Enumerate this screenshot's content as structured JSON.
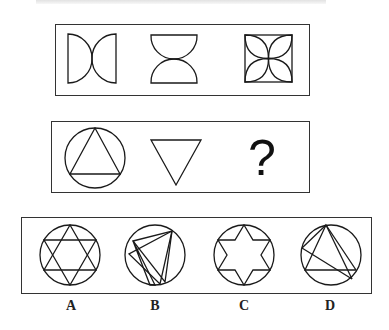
{
  "header": {
    "cut_off_text": ""
  },
  "question": {
    "row1": {
      "figures": [
        {
          "name": "two-semicircles-facing-out-horizontal",
          "description": "square with left/right semicircles meeting at center"
        },
        {
          "name": "two-semicircles-facing-out-vertical",
          "description": "top/bottom semicircles meeting at center"
        },
        {
          "name": "square-with-four-petals",
          "description": "square containing four arc petals"
        }
      ]
    },
    "row2": {
      "figures": [
        {
          "name": "circle-with-inscribed-triangle",
          "description": "circle containing upright triangle"
        },
        {
          "name": "inverted-triangle",
          "description": "downward-pointing triangle"
        },
        {
          "name": "unknown",
          "label": "?"
        }
      ]
    }
  },
  "options": [
    {
      "label": "A",
      "description": "circle with inscribed six-pointed star (two triangles)"
    },
    {
      "label": "B",
      "description": "circle with rotated overlapping triangles"
    },
    {
      "label": "C",
      "description": "circle with six-pointed star outline"
    },
    {
      "label": "D",
      "description": "circle with triangle and extra chords"
    }
  ]
}
